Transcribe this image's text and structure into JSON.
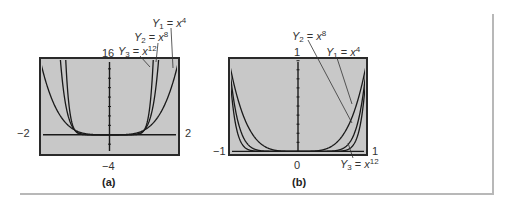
{
  "chart_data": [
    {
      "type": "line",
      "panel": "(a)",
      "title": "",
      "window": {
        "xmin": -2,
        "xmax": 2,
        "ymin": -4,
        "ymax": 16
      },
      "tick_labels": {
        "xmin": "−2",
        "xmax": "2",
        "ymin": "−4",
        "ymax": "16"
      },
      "series": [
        {
          "name": "Y1 = x^4",
          "function": "x^4",
          "label_var": "Y",
          "label_sub": "1",
          "label_base": "x",
          "label_exp": "4"
        },
        {
          "name": "Y2 = x^8",
          "function": "x^8",
          "label_var": "Y",
          "label_sub": "2",
          "label_base": "x",
          "label_exp": "8"
        },
        {
          "name": "Y3 = x^12",
          "function": "x^12",
          "label_var": "Y",
          "label_sub": "3",
          "label_base": "x",
          "label_exp": "12"
        }
      ],
      "grid": false,
      "caption": "(a)"
    },
    {
      "type": "line",
      "panel": "(b)",
      "title": "",
      "window": {
        "xmin": -1,
        "xmax": 1,
        "ymin": 0,
        "ymax": 1
      },
      "tick_labels": {
        "xmin": "−1",
        "xmax": "1",
        "ymin": "0",
        "ymax": "1"
      },
      "series": [
        {
          "name": "Y1 = x^4",
          "function": "x^4",
          "label_var": "Y",
          "label_sub": "1",
          "label_base": "x",
          "label_exp": "4"
        },
        {
          "name": "Y2 = x^8",
          "function": "x^8",
          "label_var": "Y",
          "label_sub": "2",
          "label_base": "x",
          "label_exp": "8"
        },
        {
          "name": "Y3 = x^12",
          "function": "x^12",
          "label_var": "Y",
          "label_sub": "3",
          "label_base": "x",
          "label_exp": "12"
        }
      ],
      "grid": false,
      "caption": "(b)"
    }
  ],
  "colors": {
    "screen_bg": "#c8c8c8",
    "screen_border": "#2a2a2a",
    "curve": "#1a1a1a",
    "frame_line": "#b8b8b8"
  },
  "eq": {
    "eq_sign": "="
  }
}
